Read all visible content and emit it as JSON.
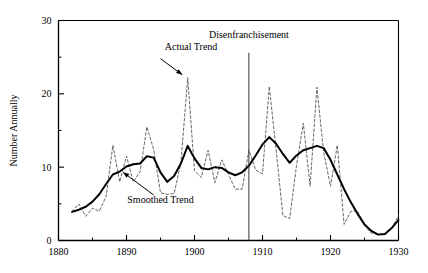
{
  "chart_data": {
    "type": "line",
    "title": "",
    "xlabel": "",
    "ylabel": "Number Annually",
    "xlim": [
      1880,
      1930
    ],
    "ylim": [
      0,
      30
    ],
    "xticks": [
      1880,
      1890,
      1900,
      1910,
      1920,
      1930
    ],
    "xtick_labels": [
      "1880",
      "1890",
      "1900",
      "1910",
      "1920",
      "1930"
    ],
    "yticks": [
      0,
      10,
      20,
      30
    ],
    "ytick_labels": [
      "0",
      "10",
      "20",
      "30"
    ],
    "yminorticks": [
      5,
      15,
      25
    ],
    "xminorticks": [
      1885,
      1895,
      1905,
      1915,
      1925
    ],
    "grid": false,
    "legend_position": "none",
    "annotations": [
      {
        "name": "actual-trend",
        "text": "Actual Trend",
        "text_x": 1899.5,
        "text_y": 26.0,
        "arrow_from_x": 1895.0,
        "arrow_from_y": 24.8,
        "arrow_to_x": 1898.2,
        "arrow_to_y": 22.6
      },
      {
        "name": "smoothed-trend",
        "text": "Smoothed Trend",
        "text_x": 1895.0,
        "text_y": 5.1,
        "arrow_from_x": 1894.0,
        "arrow_from_y": 6.2,
        "arrow_to_x": 1889.5,
        "arrow_to_y": 9.3
      },
      {
        "name": "disenfranchisement",
        "text": "Disenfranchisement",
        "text_x": 1908.0,
        "text_y": 27.6,
        "vline_x": 1908.0,
        "vline_y_top": 25.6,
        "vline_y_bottom": 0
      }
    ],
    "series": [
      {
        "name": "Actual Trend",
        "style": "dashed",
        "color": "#555555",
        "x": [
          1882,
          1883,
          1884,
          1885,
          1886,
          1887,
          1888,
          1889,
          1890,
          1891,
          1892,
          1893,
          1894,
          1895,
          1896,
          1897,
          1898,
          1899,
          1900,
          1901,
          1902,
          1903,
          1904,
          1905,
          1906,
          1907,
          1908,
          1909,
          1910,
          1911,
          1912,
          1913,
          1914,
          1915,
          1916,
          1917,
          1918,
          1919,
          1920,
          1921,
          1922,
          1923,
          1924,
          1925,
          1926,
          1927,
          1928,
          1929,
          1930
        ],
        "values": [
          4.0,
          5.0,
          3.3,
          4.4,
          4.0,
          6.0,
          13.0,
          8.0,
          11.5,
          8.0,
          9.4,
          15.5,
          12.4,
          6.5,
          6.3,
          6.4,
          10.6,
          22.2,
          9.5,
          8.6,
          12.3,
          7.9,
          11.0,
          9.0,
          7.0,
          7.0,
          12.3,
          9.6,
          9.1,
          21.0,
          12.4,
          3.4,
          3.0,
          10.2,
          16.0,
          7.4,
          20.9,
          12.0,
          7.4,
          13.0,
          2.2,
          4.0,
          4.0,
          2.0,
          1.0,
          0.9,
          0.8,
          1.7,
          3.4
        ]
      },
      {
        "name": "Smoothed Trend",
        "style": "solid",
        "color": "#000000",
        "x": [
          1882,
          1883,
          1884,
          1885,
          1886,
          1887,
          1888,
          1889,
          1890,
          1891,
          1892,
          1893,
          1894,
          1895,
          1896,
          1897,
          1898,
          1899,
          1900,
          1901,
          1902,
          1903,
          1904,
          1905,
          1906,
          1907,
          1908,
          1909,
          1910,
          1911,
          1912,
          1913,
          1914,
          1915,
          1916,
          1917,
          1918,
          1919,
          1920,
          1921,
          1922,
          1923,
          1924,
          1925,
          1926,
          1927,
          1928,
          1929,
          1930
        ],
        "values": [
          3.9,
          4.2,
          4.6,
          5.3,
          6.3,
          7.7,
          9.0,
          9.4,
          10.1,
          10.4,
          10.5,
          11.5,
          11.3,
          9.3,
          8.0,
          8.8,
          10.5,
          12.9,
          11.2,
          9.9,
          9.7,
          10.0,
          9.9,
          9.3,
          8.9,
          9.3,
          10.2,
          11.6,
          13.1,
          14.1,
          13.2,
          11.8,
          10.6,
          11.6,
          12.3,
          12.6,
          12.9,
          12.6,
          11.0,
          9.0,
          7.0,
          5.2,
          3.6,
          2.2,
          1.3,
          0.8,
          0.9,
          1.7,
          2.8
        ]
      }
    ]
  }
}
